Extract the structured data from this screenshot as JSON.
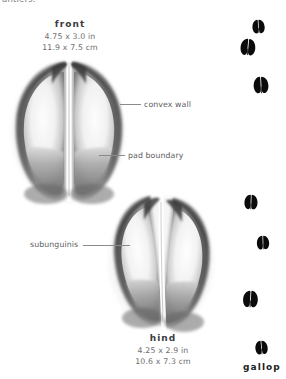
{
  "page": {
    "background_color": "#ffffff",
    "width": 286,
    "height": 379,
    "cutoff_text": "antlers."
  },
  "front": {
    "title": "front",
    "dim_in": "4.75 x 3.0 in",
    "dim_cm": "11.9 x 7.5 cm"
  },
  "hind": {
    "title": "hind",
    "dim_in": "4.25 x 2.9 in",
    "dim_cm": "10.6 x 7.3 cm"
  },
  "annotations": {
    "convex_wall": "convex wall",
    "pad_boundary": "pad boundary",
    "subunguinis": "subunguinis"
  },
  "gait": {
    "label": "gallop",
    "ink_color": "#0b0b0b",
    "tracks": [
      {
        "id": "track-1",
        "x": 250,
        "y": 19,
        "w": 17,
        "h": 15,
        "rot": -4
      },
      {
        "id": "track-2",
        "x": 238,
        "y": 38,
        "w": 20,
        "h": 18,
        "rot": 5
      },
      {
        "id": "track-3",
        "x": 252,
        "y": 76,
        "w": 18,
        "h": 18,
        "rot": -3
      },
      {
        "id": "track-4",
        "x": 243,
        "y": 194,
        "w": 16,
        "h": 16,
        "rot": 2
      },
      {
        "id": "track-5",
        "x": 256,
        "y": 235,
        "w": 14,
        "h": 15,
        "rot": -2
      },
      {
        "id": "track-6",
        "x": 240,
        "y": 290,
        "w": 21,
        "h": 18,
        "rot": 3
      },
      {
        "id": "track-7",
        "x": 252,
        "y": 340,
        "w": 19,
        "h": 15,
        "rot": -5
      }
    ]
  },
  "icons": {
    "front_track": "hoof-print-front-icon",
    "hind_track": "hoof-print-hind-icon",
    "gait_track": "hoof-print-small-icon"
  }
}
